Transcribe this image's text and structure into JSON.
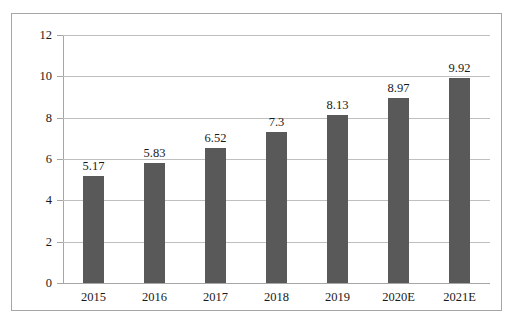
{
  "chart_data": {
    "type": "bar",
    "title": "",
    "subtitle": "",
    "xlabel": "",
    "ylabel": "",
    "categories": [
      "2015",
      "2016",
      "2017",
      "2018",
      "2019",
      "2020E",
      "2021E"
    ],
    "values": [
      5.17,
      5.83,
      6.52,
      7.3,
      8.13,
      8.97,
      9.92
    ],
    "value_labels": [
      "5.17",
      "5.83",
      "6.52",
      "7.3",
      "8.13",
      "8.97",
      "9.92"
    ],
    "ylim": [
      0,
      12
    ],
    "y_ticks": [
      0,
      2,
      4,
      6,
      8,
      10,
      12
    ],
    "y_tick_labels": [
      "0",
      "2",
      "4",
      "6",
      "8",
      "10",
      "12"
    ],
    "grid": true,
    "legend": "none",
    "series_color": "#595959",
    "gridline_color": "#bfbfbf",
    "axis_color": "#a6a6a6",
    "text_color": "#1a1a1a",
    "background": "#ffffff"
  }
}
